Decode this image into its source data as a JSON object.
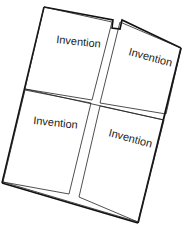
{
  "figure": {
    "stroke_color": "#111111",
    "background": "#ffffff",
    "panels": [
      {
        "id": "top-left",
        "label": "Invention"
      },
      {
        "id": "top-right",
        "label": "Invention"
      },
      {
        "id": "bottom-left",
        "label": "Invention"
      },
      {
        "id": "bottom-right",
        "label": "Invention"
      }
    ]
  }
}
